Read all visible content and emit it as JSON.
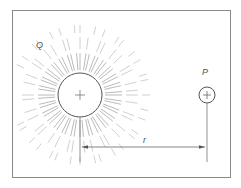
{
  "diagram": {
    "labels": {
      "charge_q": "Q",
      "point_p": "P",
      "distance": "r"
    },
    "colors": {
      "line": "#6a6a6a",
      "rays": "#9a9a9a",
      "frame": "#8a8a8a",
      "background": "#ffffff"
    },
    "q_sign": "+",
    "p_sign": "+"
  }
}
